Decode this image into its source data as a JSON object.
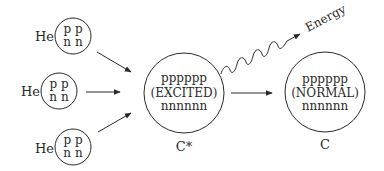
{
  "diagram": {
    "helium_nuclei": [
      {
        "label": "He",
        "top_row": "p p",
        "bottom_row": "n n"
      },
      {
        "label": "He",
        "top_row": "p p",
        "bottom_row": "n n"
      },
      {
        "label": "He",
        "top_row": "p p",
        "bottom_row": "n n"
      }
    ],
    "excited_nucleus": {
      "protons": "pppppp",
      "state": "(EXCITED)",
      "neutrons": "nnnnnn",
      "label": "C*"
    },
    "normal_nucleus": {
      "protons": "pppppp",
      "state": "(NORMAL)",
      "neutrons": "nnnnnn",
      "label": "C"
    },
    "energy_label": "Energy",
    "colors": {
      "stroke": "#2a2a2a",
      "background": "#ffffff"
    }
  }
}
